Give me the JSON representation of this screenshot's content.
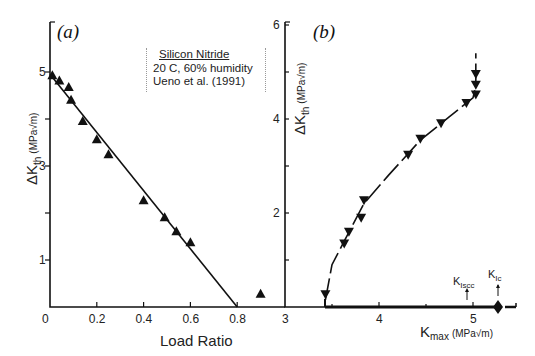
{
  "chart_data": [
    {
      "panel": "(a)",
      "type": "scatter",
      "title": "",
      "xlabel": "Load Ratio",
      "ylabel": "ΔK_th (MPa√m)",
      "xlim": [
        0,
        0.85
      ],
      "ylim": [
        0,
        5.6
      ],
      "xticks": [
        0,
        0.2,
        0.4,
        0.6,
        0.8
      ],
      "xtick_labels": [
        "0",
        "0.2",
        "0.4",
        "0.6",
        "0.8"
      ],
      "yticks": [
        0,
        1,
        2,
        3,
        4,
        5
      ],
      "ytick_labels": [
        "0",
        "1",
        "",
        "3",
        "",
        "5"
      ],
      "grid": false,
      "legend": {
        "title": "Silicon Nitride",
        "lines": [
          "20 C, 60% humidity",
          "Ueno et al. (1991)"
        ],
        "position": "upper right"
      },
      "series": [
        {
          "name": "Silicon Nitride data",
          "marker": "triangle-up",
          "x": [
            0.01,
            0.04,
            0.08,
            0.09,
            0.14,
            0.2,
            0.25,
            0.4,
            0.49,
            0.54,
            0.6,
            0.9
          ],
          "y": [
            4.93,
            4.82,
            4.68,
            4.41,
            3.96,
            3.57,
            3.25,
            2.27,
            1.91,
            1.61,
            1.38,
            0.28
          ]
        },
        {
          "name": "linear fit",
          "type": "line",
          "x": [
            0,
            0.8
          ],
          "y": [
            4.95,
            0
          ]
        }
      ]
    },
    {
      "panel": "(b)",
      "type": "scatter",
      "title": "",
      "xlabel": "K_max (MPa√m)",
      "ylabel": "ΔK_th (MPa√m)",
      "xlim": [
        3,
        5.5
      ],
      "ylim": [
        0,
        6
      ],
      "xticks": [
        3,
        4,
        5
      ],
      "xtick_labels": [
        "3",
        "4",
        "5"
      ],
      "yticks": [
        0,
        1,
        2,
        3,
        4,
        5,
        6
      ],
      "ytick_labels": [
        "",
        "",
        "2",
        "",
        "4",
        "",
        "6"
      ],
      "grid": false,
      "series": [
        {
          "name": "Silicon Nitride data",
          "marker": "triangle-down",
          "x": [
            3.43,
            3.63,
            3.68,
            3.81,
            3.84,
            4.31,
            4.44,
            4.66,
            4.93,
            5.03,
            5.03,
            5.03
          ],
          "y": [
            0.27,
            1.35,
            1.6,
            1.9,
            2.27,
            3.24,
            3.58,
            3.91,
            4.34,
            4.52,
            4.73,
            4.96
          ]
        },
        {
          "name": "dashed trend",
          "type": "line",
          "x": [
            3.43,
            3.5,
            3.63,
            3.84,
            4.1,
            4.44,
            4.75,
            5.0,
            5.03,
            5.03
          ],
          "y": [
            0.15,
            0.9,
            1.4,
            2.2,
            2.8,
            3.55,
            4.05,
            4.45,
            4.7,
            5.4
          ]
        }
      ],
      "annotations": [
        {
          "text": "K_Iscc",
          "x": 4.95,
          "y": 0,
          "arrow": true
        },
        {
          "text": "K_Ic",
          "x": 5.28,
          "y": 0,
          "marker": "diamond",
          "arrow": true
        }
      ]
    }
  ],
  "panel_a": {
    "label": "(a)",
    "xlabel": "Load Ratio",
    "ylabel_main": "ΔK",
    "ylabel_sub": "th",
    "ylabel_units": "(MPa√m)",
    "legend_title": "Silicon Nitride",
    "legend_line1": "20 C, 60% humidity",
    "legend_line2": "Ueno et al. (1991)"
  },
  "panel_b": {
    "label": "(b)",
    "xlabel_main": "K",
    "xlabel_sub": "max",
    "xlabel_units": "(MPa√m)",
    "ylabel_main": "ΔK",
    "ylabel_sub": "th",
    "ylabel_units": "(MPa√m)",
    "kiscc_main": "K",
    "kiscc_sub": "Iscc",
    "kic_main": "K",
    "kic_sub": "Ic"
  }
}
